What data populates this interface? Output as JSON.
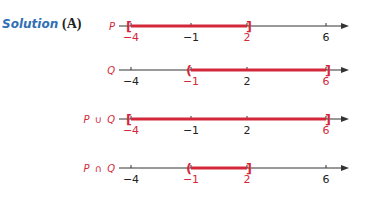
{
  "header": {
    "solution_label": "Solution",
    "part_label": "(A)"
  },
  "colors": {
    "highlight": "#d4283a",
    "axis": "#333333",
    "solution": "#2f6fb3"
  },
  "axis": {
    "ticks": [
      -4,
      -1,
      2,
      6
    ],
    "min": -4,
    "max": 6
  },
  "lines": [
    {
      "label": "P",
      "interval": [
        -4,
        2
      ],
      "left_bracket": "[",
      "right_bracket": "]",
      "highlight_ticks": [
        -4,
        2
      ]
    },
    {
      "label": "Q",
      "interval": [
        -1,
        6
      ],
      "left_bracket": "(",
      "right_bracket": "]",
      "highlight_ticks": [
        -1,
        6
      ]
    },
    {
      "label": "P ∪ Q",
      "interval": [
        -4,
        6
      ],
      "left_bracket": "[",
      "right_bracket": "]",
      "highlight_ticks": [
        -4,
        6
      ]
    },
    {
      "label": "P ∩ Q",
      "interval": [
        -1,
        2
      ],
      "left_bracket": "(",
      "right_bracket": "]",
      "highlight_ticks": [
        -1,
        2
      ]
    }
  ]
}
